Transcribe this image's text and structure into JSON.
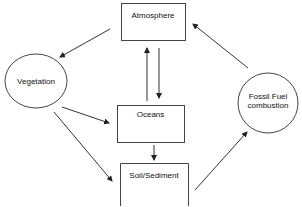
{
  "diagram": {
    "nodes": [
      {
        "id": "atmosphere",
        "label": "Atmosphere",
        "shape": "rect"
      },
      {
        "id": "vegetation",
        "label": "Vegetation",
        "shape": "ellipse"
      },
      {
        "id": "oceans",
        "label": "Oceans",
        "shape": "rect"
      },
      {
        "id": "soil",
        "label": "Soil/Sediment",
        "shape": "rect"
      },
      {
        "id": "fossil",
        "label_line1": "Fossil Fuel",
        "label_line2": "combustion",
        "shape": "ellipse"
      }
    ],
    "edges": [
      {
        "from": "atmosphere",
        "to": "vegetation"
      },
      {
        "from": "oceans",
        "to": "atmosphere"
      },
      {
        "from": "atmosphere",
        "to": "oceans"
      },
      {
        "from": "vegetation",
        "to": "oceans"
      },
      {
        "from": "vegetation",
        "to": "soil"
      },
      {
        "from": "oceans",
        "to": "soil"
      },
      {
        "from": "soil",
        "to": "fossil"
      },
      {
        "from": "fossil",
        "to": "atmosphere"
      }
    ],
    "colors": {
      "stroke": "#333333",
      "text": "#111111",
      "background": "#ffffff"
    }
  }
}
